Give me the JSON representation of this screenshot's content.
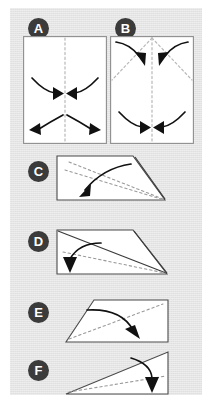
{
  "document": {
    "type": "origami-folding-instructions",
    "background_color": "#e7e7e7",
    "page_color": "#ffffff",
    "ink_color": "#111111",
    "badge_color": "#3b3b3b",
    "badge_text_color": "#ffffff",
    "crease_color": "#b8b8b8",
    "sheet_fill": "#ffffff",
    "sheet_stroke": "#8e8e8e"
  },
  "steps": [
    {
      "label": "A",
      "name": "step-a",
      "shape": "rectangle",
      "description": "Square sheet with vertical dashed center crease; curved arrows fold edges toward the center line and outward at the bottom",
      "crease_lines": [
        "vertical-center"
      ],
      "arrows": [
        {
          "name": "arrow-left-in",
          "direction": "right",
          "style": "curved"
        },
        {
          "name": "arrow-right-in",
          "direction": "left",
          "style": "curved"
        },
        {
          "name": "arrow-lower-left-out",
          "direction": "left",
          "style": "curved"
        },
        {
          "name": "arrow-lower-right-out",
          "direction": "right",
          "style": "curved"
        }
      ]
    },
    {
      "label": "B",
      "name": "step-b",
      "shape": "rectangle",
      "description": "Sheet with vertical center crease plus two diagonal creases; arrows bring top corners down to the center and bottom edges in to the center",
      "crease_lines": [
        "vertical-center",
        "diagonal-left",
        "diagonal-right"
      ],
      "arrows": [
        {
          "name": "arrow-top-left-down",
          "direction": "down-right",
          "style": "curved"
        },
        {
          "name": "arrow-top-right-down",
          "direction": "down-left",
          "style": "curved"
        },
        {
          "name": "arrow-bottom-left-in",
          "direction": "right",
          "style": "curved"
        },
        {
          "name": "arrow-bottom-right-in",
          "direction": "left",
          "style": "curved"
        }
      ]
    },
    {
      "label": "C",
      "name": "step-c",
      "shape": "trapezoid",
      "description": "Folded trapezoid with dashed creases running to the lower right; a curved arrow sweeps from the right down to the lower left",
      "crease_lines": [
        "diagonal-upper",
        "diagonal-lower"
      ],
      "arrows": [
        {
          "name": "arrow-fold-left",
          "direction": "down-left",
          "style": "curved"
        }
      ]
    },
    {
      "label": "D",
      "name": "step-d",
      "shape": "trapezoid-with-diagonal",
      "description": "Trapezoid with a solid diagonal edge from top-left to bottom-right and a dashed crease; a short curved arrow folds the left flap straight down",
      "crease_lines": [
        "solid-diagonal",
        "dashed-diagonal"
      ],
      "arrows": [
        {
          "name": "arrow-fold-down",
          "direction": "down",
          "style": "curved"
        }
      ]
    },
    {
      "label": "E",
      "name": "step-e",
      "shape": "parallelogram",
      "description": "Parallelogram with a dashed crease along its long axis; a curved arrow folds from the upper left across to the lower right",
      "crease_lines": [
        "diagonal-center"
      ],
      "arrows": [
        {
          "name": "arrow-fold-right",
          "direction": "down-right",
          "style": "curved"
        }
      ]
    },
    {
      "label": "F",
      "name": "step-f",
      "shape": "triangle",
      "description": "Flat triangle with a dashed crease near the base; a curved arrow folds the upper flap down at the right edge",
      "crease_lines": [
        "base-parallel"
      ],
      "arrows": [
        {
          "name": "arrow-fold-down-right",
          "direction": "down",
          "style": "curved"
        }
      ]
    }
  ]
}
